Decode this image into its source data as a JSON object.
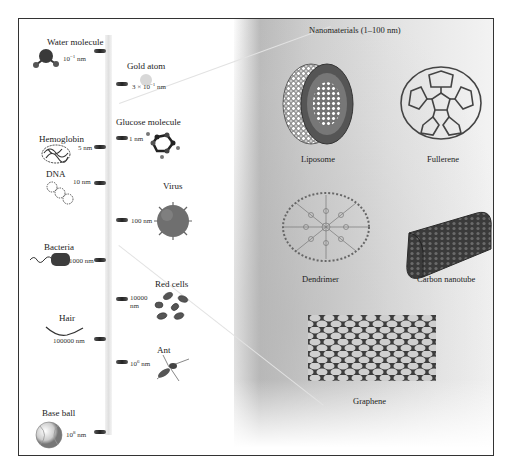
{
  "title": "Nanomaterials (1–100 nm)",
  "scale": [
    {
      "name": "Water molecule",
      "size": "10",
      "exp": "−1",
      "unit": "nm"
    },
    {
      "name": "Gold atom",
      "size": "3 × 10",
      "exp": "−1",
      "unit": "nm"
    },
    {
      "name": "Glucose molecule",
      "size": "1",
      "exp": "",
      "unit": "nm"
    },
    {
      "name": "Hemoglobin",
      "size": "5",
      "exp": "",
      "unit": "nm"
    },
    {
      "name": "DNA",
      "size": "10",
      "exp": "",
      "unit": "nm"
    },
    {
      "name": "Virus",
      "size": "100",
      "exp": "",
      "unit": "nm"
    },
    {
      "name": "Bacteria",
      "size": "1000",
      "exp": "",
      "unit": "nm"
    },
    {
      "name": "Red cells",
      "size": "10000",
      "exp": "",
      "unit": "nm"
    },
    {
      "name": "Hair",
      "size": "100000",
      "exp": "",
      "unit": "nm"
    },
    {
      "name": "Ant",
      "size": "10",
      "exp": "6",
      "unit": "nm"
    },
    {
      "name": "Base ball",
      "size": "10",
      "exp": "8",
      "unit": "nm"
    }
  ],
  "nanomaterials": [
    {
      "name": "Liposome"
    },
    {
      "name": "Fullerene"
    },
    {
      "name": "Dendrimer"
    },
    {
      "name": "Carbon nanotube"
    },
    {
      "name": "Graphene"
    }
  ]
}
